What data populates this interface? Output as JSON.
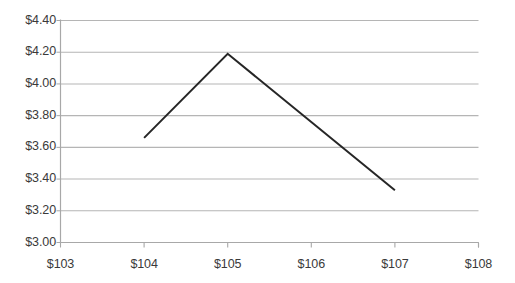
{
  "chart_data": {
    "type": "line",
    "title": "",
    "xlabel": "",
    "ylabel": "",
    "xlim": [
      103,
      108
    ],
    "ylim": [
      3.0,
      4.4
    ],
    "grid": true,
    "legend": false,
    "x_tick_labels": [
      "$103",
      "$104",
      "$105",
      "$106",
      "$107",
      "$108"
    ],
    "x_ticks": [
      103,
      104,
      105,
      106,
      107,
      108
    ],
    "y_tick_labels": [
      "$3.00",
      "$3.20",
      "$3.40",
      "$3.60",
      "$3.80",
      "$4.00",
      "$4.20",
      "$4.40"
    ],
    "y_ticks": [
      3.0,
      3.2,
      3.4,
      3.6,
      3.8,
      4.0,
      4.2,
      4.4
    ],
    "series": [
      {
        "name": "",
        "color": "#262626",
        "line_width": 2,
        "x": [
          104,
          105,
          107
        ],
        "values": [
          3.66,
          4.19,
          3.33
        ]
      }
    ]
  },
  "axes": {
    "axis_color": "#a8a8a8",
    "grid_color": "#b5b5b5",
    "tick_color": "#a8a8a8",
    "background": "#ffffff"
  }
}
